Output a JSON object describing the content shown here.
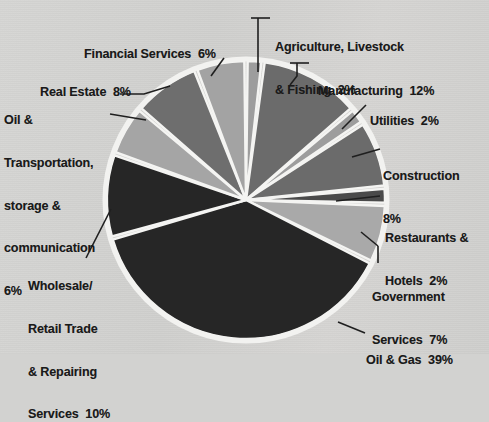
{
  "figure": {
    "background_color": "#d2d2d0",
    "leader_line_color": "#1f1f1f",
    "pie_outline_color": "#f2f2f0",
    "slice_gap_color": "#f4f4f2"
  },
  "chart_data": {
    "type": "pie",
    "title": "",
    "xlabel": "",
    "ylabel": "",
    "legend_position": "callout-labels",
    "grid": false,
    "units": "percent",
    "total": 102,
    "start_angle_deg": -90,
    "direction": "clockwise",
    "categories": [
      "Agriculture, Livestock & Fishing",
      "Manufacturing",
      "Utilities",
      "Construction",
      "Restaurants & Hotels",
      "Government Services",
      "Oil & Gas",
      "Wholesale/ Retail Trade & Repairing Services",
      "Oil & Transportation, storage & communication",
      "Real Estate",
      "Financial Services"
    ],
    "values": [
      2,
      12,
      2,
      8,
      2,
      7,
      39,
      10,
      6,
      8,
      6
    ],
    "colors": [
      "#9d9d9d",
      "#6b6b6b",
      "#9d9d9d",
      "#6b6b6b",
      "#4a4a4a",
      "#a9a9a9",
      "#262626",
      "#262626",
      "#a5a5a5",
      "#6e6e6e",
      "#a3a3a3"
    ],
    "slices": [
      {
        "label": "Agriculture, Livestock & Fishing",
        "value": 2,
        "display": "2%",
        "color": "#9d9d9d"
      },
      {
        "label": "Manufacturing",
        "value": 12,
        "display": "12%",
        "color": "#6b6b6b"
      },
      {
        "label": "Utilities",
        "value": 2,
        "display": "2%",
        "color": "#9d9d9d"
      },
      {
        "label": "Construction",
        "value": 8,
        "display": "8%",
        "color": "#6b6b6b"
      },
      {
        "label": "Restaurants & Hotels",
        "value": 2,
        "display": "2%",
        "color": "#4a4a4a"
      },
      {
        "label": "Government Services",
        "value": 7,
        "display": "7%",
        "color": "#a9a9a9"
      },
      {
        "label": "Oil & Gas",
        "value": 39,
        "display": "39%",
        "color": "#262626"
      },
      {
        "label": "Wholesale/ Retail Trade & Repairing Services",
        "value": 10,
        "display": "10%",
        "color": "#262626"
      },
      {
        "label": "Oil & Transportation, storage & communication",
        "value": 6,
        "display": "6%",
        "color": "#a5a5a5"
      },
      {
        "label": "Real Estate",
        "value": 8,
        "display": "8%",
        "color": "#6e6e6e"
      },
      {
        "label": "Financial Services",
        "value": 6,
        "display": "6%",
        "color": "#a3a3a3"
      }
    ]
  },
  "labels": {
    "agriculture": {
      "line1": "Agriculture, Livestock",
      "line2": "& Fishing  2%"
    },
    "manufacturing": {
      "line1": "Manufacturing  12%"
    },
    "utilities": {
      "line1": "Utilities  2%"
    },
    "construction": {
      "line1": "Construction",
      "line2": "8%"
    },
    "restaurants": {
      "line1": "Restaurants &",
      "line2": "Hotels  2%"
    },
    "government": {
      "line1": "Government",
      "line2": "Services  7%"
    },
    "oilgas": {
      "line1": "Oil & Gas  39%"
    },
    "wholesale": {
      "line1": "Wholesale/",
      "line2": "Retail Trade",
      "line3": "& Repairing",
      "line4": "Services  10%"
    },
    "oiltransport": {
      "line1": "Oil &",
      "line2": "Transportation,",
      "line3": "storage &",
      "line4": "communication",
      "line5": "6%"
    },
    "realestate": {
      "line1": "Real Estate  8%"
    },
    "financial": {
      "line1": "Financial Services  6%"
    }
  }
}
